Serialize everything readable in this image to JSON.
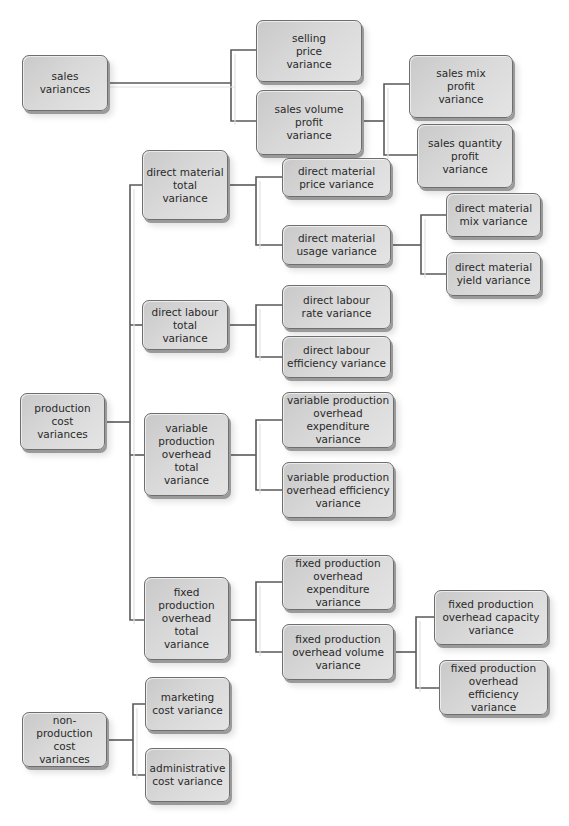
{
  "diagram": {
    "colors": {
      "line": "#5a5a5a",
      "box_fill": "#d6d6d6",
      "box_border": "#6e6e6e",
      "text": "#2a2a2a"
    },
    "nodes": {
      "sales_variances": "sales\nvariances",
      "selling_price_variance": "selling\nprice\nvariance",
      "sales_volume_profit_variance": "sales volume\nprofit\nvariance",
      "sales_mix_profit_variance": "sales mix\nprofit\nvariance",
      "sales_quantity_profit_variance": "sales quantity\nprofit\nvariance",
      "production_cost_variances": "production\ncost\nvariances",
      "direct_material_total_variance": "direct material\ntotal\nvariance",
      "direct_material_price_variance": "direct material\nprice variance",
      "direct_material_usage_variance": "direct material\nusage variance",
      "direct_material_mix_variance": "direct material\nmix variance",
      "direct_material_yield_variance": "direct material\nyield variance",
      "direct_labour_total_variance": "direct labour\ntotal\nvariance",
      "direct_labour_rate_variance": "direct labour\nrate variance",
      "direct_labour_efficiency_variance": "direct labour\nefficiency variance",
      "variable_production_overhead_total_variance": "variable\nproduction\noverhead\ntotal\nvariance",
      "variable_production_overhead_expenditure_variance": "variable production\noverhead expenditure\nvariance",
      "variable_production_overhead_efficiency_variance": "variable production\noverhead efficiency\nvariance",
      "fixed_production_overhead_total_variance": "fixed\nproduction\noverhead\ntotal\nvariance",
      "fixed_production_overhead_expenditure_variance": "fixed production\noverhead expenditure\nvariance",
      "fixed_production_overhead_volume_variance": "fixed production\noverhead volume\nvariance",
      "fixed_production_overhead_capacity_variance": "fixed production\noverhead capacity\nvariance",
      "fixed_production_overhead_efficiency_variance": "fixed production\noverhead efficiency\nvariance",
      "non_production_cost_variances": "non-production\ncost\nvariances",
      "marketing_cost_variance": "marketing\ncost variance",
      "administrative_cost_variance": "administrative\ncost variance"
    }
  }
}
